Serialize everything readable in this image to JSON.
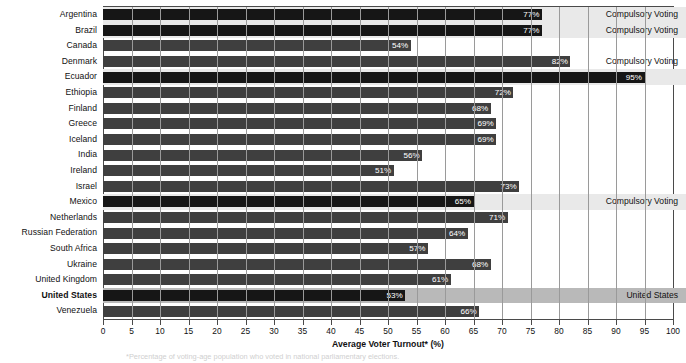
{
  "chart_data": {
    "type": "bar",
    "orientation": "horizontal",
    "title": "",
    "xlabel": "Average Voter Turnout* (%)",
    "ylabel": "",
    "xlim": [
      0,
      100
    ],
    "xticks": [
      0,
      5,
      10,
      15,
      20,
      25,
      30,
      35,
      40,
      45,
      50,
      55,
      60,
      65,
      70,
      75,
      80,
      85,
      90,
      95,
      100
    ],
    "grid": "vertical",
    "legend": "none",
    "categories": [
      "Argentina",
      "Brazil",
      "Canada",
      "Denmark",
      "Ecuador",
      "Ethiopia",
      "Finland",
      "Greece",
      "Iceland",
      "India",
      "Ireland",
      "Israel",
      "Mexico",
      "Netherlands",
      "Russian Federation",
      "South Africa",
      "Ukraine",
      "United Kingdom",
      "United States",
      "Venezuela"
    ],
    "values": [
      77,
      77,
      54,
      82,
      95,
      72,
      68,
      69,
      69,
      56,
      51,
      73,
      65,
      71,
      64,
      57,
      68,
      61,
      53,
      66
    ],
    "value_labels": [
      "77%",
      "77%",
      "54%",
      "82%",
      "95%",
      "72%",
      "68%",
      "69%",
      "69%",
      "56%",
      "51%",
      "73%",
      "65%",
      "71%",
      "64%",
      "57%",
      "68%",
      "61%",
      "53%",
      "66%"
    ],
    "annotations": [
      {
        "category": "Argentina",
        "text": "Compulsory Voting"
      },
      {
        "category": "Brazil",
        "text": "Compulsory Voting"
      },
      {
        "category": "Denmark",
        "text": "Compulsory Voting"
      },
      {
        "category": "Mexico",
        "text": "Compulsory Voting"
      },
      {
        "category": "United States",
        "text": "United States"
      }
    ],
    "highlighted_rows": [
      "Argentina",
      "Brazil",
      "Ecuador",
      "Mexico",
      "United States"
    ],
    "colors": {
      "bar_default": "#3f3f3f",
      "bar_highlight": "#161616",
      "band_compulsory": "#e9e9e9",
      "band_usa": "#b9b9b9",
      "gridline": "#9a9a9a",
      "axis": "#4a4a4a",
      "text": "#111111",
      "value_text": "#ffffff"
    }
  },
  "rows": [
    {
      "label": "Argentina",
      "value": 77,
      "value_label": "77%",
      "note": "Compulsory Voting",
      "band": "compulsory",
      "dark": true,
      "bold": false
    },
    {
      "label": "Brazil",
      "value": 77,
      "value_label": "77%",
      "note": "Compulsory Voting",
      "band": "compulsory",
      "dark": true,
      "bold": false
    },
    {
      "label": "Canada",
      "value": 54,
      "value_label": "54%",
      "note": "",
      "band": "none",
      "dark": false,
      "bold": false
    },
    {
      "label": "Denmark",
      "value": 82,
      "value_label": "82%",
      "note": "Compulsory Voting",
      "band": "none",
      "dark": false,
      "bold": false
    },
    {
      "label": "Ecuador",
      "value": 95,
      "value_label": "95%",
      "note": "",
      "band": "compulsory",
      "dark": true,
      "bold": false
    },
    {
      "label": "Ethiopia",
      "value": 72,
      "value_label": "72%",
      "note": "",
      "band": "none",
      "dark": false,
      "bold": false
    },
    {
      "label": "Finland",
      "value": 68,
      "value_label": "68%",
      "note": "",
      "band": "none",
      "dark": false,
      "bold": false
    },
    {
      "label": "Greece",
      "value": 69,
      "value_label": "69%",
      "note": "",
      "band": "none",
      "dark": false,
      "bold": false
    },
    {
      "label": "Iceland",
      "value": 69,
      "value_label": "69%",
      "note": "",
      "band": "none",
      "dark": false,
      "bold": false
    },
    {
      "label": "India",
      "value": 56,
      "value_label": "56%",
      "note": "",
      "band": "none",
      "dark": false,
      "bold": false
    },
    {
      "label": "Ireland",
      "value": 51,
      "value_label": "51%",
      "note": "",
      "band": "none",
      "dark": false,
      "bold": false
    },
    {
      "label": "Israel",
      "value": 73,
      "value_label": "73%",
      "note": "",
      "band": "none",
      "dark": false,
      "bold": false
    },
    {
      "label": "Mexico",
      "value": 65,
      "value_label": "65%",
      "note": "Compulsory Voting",
      "band": "compulsory",
      "dark": true,
      "bold": false
    },
    {
      "label": "Netherlands",
      "value": 71,
      "value_label": "71%",
      "note": "",
      "band": "none",
      "dark": false,
      "bold": false
    },
    {
      "label": "Russian Federation",
      "value": 64,
      "value_label": "64%",
      "note": "",
      "band": "none",
      "dark": false,
      "bold": false
    },
    {
      "label": "South Africa",
      "value": 57,
      "value_label": "57%",
      "note": "",
      "band": "none",
      "dark": false,
      "bold": false
    },
    {
      "label": "Ukraine",
      "value": 68,
      "value_label": "68%",
      "note": "",
      "band": "none",
      "dark": false,
      "bold": false
    },
    {
      "label": "United Kingdom",
      "value": 61,
      "value_label": "61%",
      "note": "",
      "band": "none",
      "dark": false,
      "bold": false
    },
    {
      "label": "United States",
      "value": 53,
      "value_label": "53%",
      "note": "United States",
      "band": "usa",
      "dark": true,
      "bold": true
    },
    {
      "label": "Venezuela",
      "value": 66,
      "value_label": "66%",
      "note": "",
      "band": "none",
      "dark": false,
      "bold": false
    }
  ],
  "axis": {
    "x_title": "Average Voter Turnout* (%)",
    "ticks": [
      "0",
      "5",
      "10",
      "15",
      "20",
      "25",
      "30",
      "35",
      "40",
      "45",
      "50",
      "55",
      "60",
      "65",
      "70",
      "75",
      "80",
      "85",
      "90",
      "95",
      "100"
    ]
  },
  "footnote": "*Percentage of voting-age population who voted in national parliamentary elections."
}
